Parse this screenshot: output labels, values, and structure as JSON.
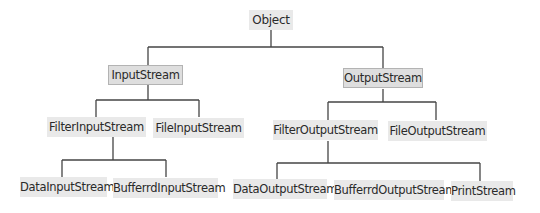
{
  "diagram": {
    "type": "class-hierarchy",
    "root": "Object",
    "nodes": {
      "object": "Object",
      "input_stream": "InputStream",
      "output_stream": "OutputStream",
      "filter_input_stream": "FilterInputStream",
      "file_input_stream": "FileInputStream",
      "filter_output_stream": "FilterOutputStream",
      "file_output_stream": "FileOutputStream",
      "data_input_stream": "DataInputStream",
      "bufferrd_input_stream": "BufferrdInputStream",
      "data_output_stream": "DataOutputStream",
      "bufferrd_output_stream": "BufferrdOutputStream",
      "print_stream": "PrintStream"
    },
    "edges": [
      [
        "Object",
        "InputStream"
      ],
      [
        "Object",
        "OutputStream"
      ],
      [
        "InputStream",
        "FilterInputStream"
      ],
      [
        "InputStream",
        "FileInputStream"
      ],
      [
        "OutputStream",
        "FilterOutputStream"
      ],
      [
        "OutputStream",
        "FileOutputStream"
      ],
      [
        "FilterInputStream",
        "DataInputStream"
      ],
      [
        "FilterInputStream",
        "BufferrdInputStream"
      ],
      [
        "FilterOutputStream",
        "DataOutputStream"
      ],
      [
        "FilterOutputStream",
        "PrintStream"
      ]
    ],
    "colors": {
      "node_fill": "#e9e9e9",
      "highlight_fill": "#dedede",
      "highlight_border": "#b3b3b3",
      "line": "#444444",
      "text": "#2a2a2a"
    }
  }
}
